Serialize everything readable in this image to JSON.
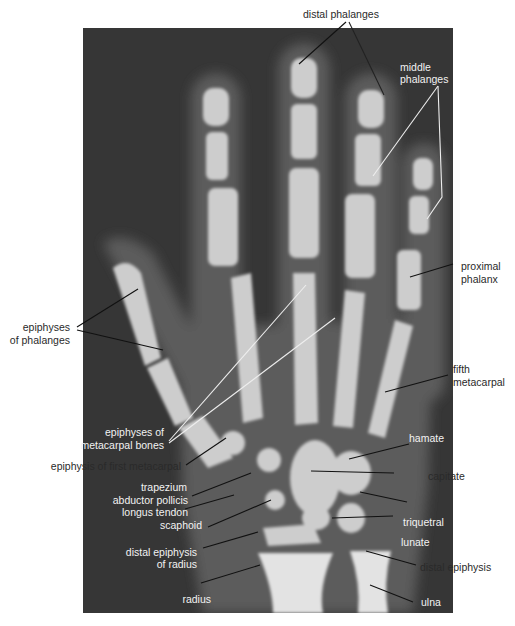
{
  "figure": {
    "colors": {
      "background": "#ffffff",
      "xray_field": "#363636",
      "bone": "#cfcfcf",
      "soft_tissue": "#5a5a5a",
      "label_dark": "#2a2a2a",
      "label_light": "#f2f2f2"
    }
  },
  "labels": {
    "distal_phalanges": "distal phalanges",
    "middle_phalanges_1": "middle",
    "middle_phalanges_2": "phalanges",
    "proximal_phalanx_1": "proximal",
    "proximal_phalanx_2": "phalanx",
    "epiphyses_phalanges_1": "epiphyses",
    "epiphyses_phalanges_2": "of phalanges",
    "fifth_metacarpal_1": "fifth",
    "fifth_metacarpal_2": "metacarpal",
    "epiphyses_metacarpal_1": "epiphyses of",
    "epiphyses_metacarpal_2": "metacarpal bones",
    "epiphysis_first_metacarpal": "epiphysis of first metacarpal",
    "trapezium": "trapezium",
    "abductor_1": "abductor pollicis",
    "abductor_2": "longus tendon",
    "scaphoid": "scaphoid",
    "distal_epiphysis_radius_1": "distal epiphysis",
    "distal_epiphysis_radius_2": "of radius",
    "radius": "radius",
    "hamate": "hamate",
    "capitate": "capitate",
    "triquetral": "triquetral",
    "lunate": "lunate",
    "distal_epiphysis_ulna": "distal epiphysis",
    "ulna": "ulna"
  }
}
